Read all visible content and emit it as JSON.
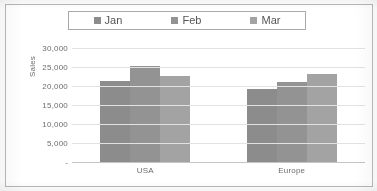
{
  "chart_data": {
    "type": "bar",
    "title": "",
    "xlabel": "",
    "ylabel": "Sales",
    "categories": [
      "USA",
      "Europe"
    ],
    "series": [
      {
        "name": "Jan",
        "values": [
          21300,
          19100
        ],
        "color": "#8c8c8c"
      },
      {
        "name": "Feb",
        "values": [
          25300,
          21000
        ],
        "color": "#939393"
      },
      {
        "name": "Mar",
        "values": [
          22600,
          23200
        ],
        "color": "#a3a3a3"
      }
    ],
    "ylim": [
      0,
      30000
    ],
    "ytick_values": [
      30000,
      25000,
      20000,
      15000,
      10000,
      5000,
      0
    ],
    "ytick_labels": [
      "30,000",
      "25,000",
      "20,000",
      "15,000",
      "10,000",
      "5,000",
      "-"
    ],
    "grid": true,
    "legend_position": "top",
    "legend_box": true
  },
  "legend": {
    "items": [
      {
        "label": "Jan",
        "swatch": "#8c8c8c",
        "swatch_icon": "legend-square-icon"
      },
      {
        "label": "Feb",
        "swatch": "#939393",
        "swatch_icon": "legend-square-icon"
      },
      {
        "label": "Mar",
        "swatch": "#a3a3a3",
        "swatch_icon": "legend-square-icon"
      }
    ]
  },
  "axes": {
    "y_title": "Sales",
    "y_labels": [
      "30,000",
      "25,000",
      "20,000",
      "15,000",
      "10,000",
      "5,000",
      "-"
    ],
    "x_labels": [
      "USA",
      "Europe"
    ]
  },
  "colors": {
    "gridline": "#e2e2e2",
    "axis_line": "#c4c4c4",
    "border": "#b9b9b9",
    "legend_border": "#a8a8a8",
    "text": "#6d6d6d",
    "background": "#ffffff"
  }
}
